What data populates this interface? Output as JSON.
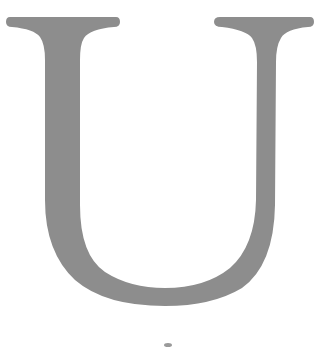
{
  "glyph": {
    "character": "U",
    "style": "serif capital letter",
    "fill_color": "#8d8d8d",
    "background_color": "#ffffff"
  },
  "speck": {
    "color": "#9a9a9a"
  }
}
